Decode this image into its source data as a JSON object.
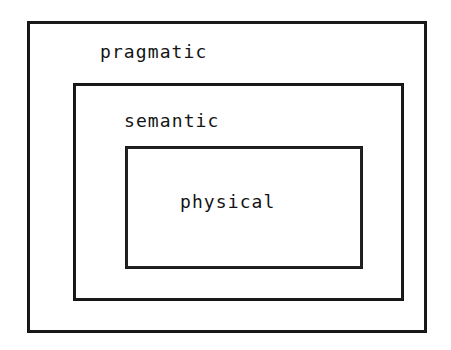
{
  "diagram": {
    "background_color": "#ffffff",
    "stroke_color": "#1a1a1a",
    "text_color": "#141414",
    "layers": [
      {
        "id": "pragmatic",
        "label": "pragmatic",
        "level": 1,
        "role": "outermost",
        "rect": {
          "x": 27,
          "y": 21,
          "width": 400,
          "height": 312
        },
        "label_position": "top-left-inset",
        "border_width": 3
      },
      {
        "id": "semantic",
        "label": "semantic",
        "level": 2,
        "role": "middle",
        "rect": {
          "x": 73,
          "y": 83,
          "width": 331,
          "height": 218
        },
        "label_position": "top-left-inset",
        "border_width": 3
      },
      {
        "id": "physical",
        "label": "physical",
        "level": 3,
        "role": "innermost",
        "rect": {
          "x": 125,
          "y": 146,
          "width": 238,
          "height": 123
        },
        "label_position": "centered",
        "border_width": 3
      }
    ]
  }
}
